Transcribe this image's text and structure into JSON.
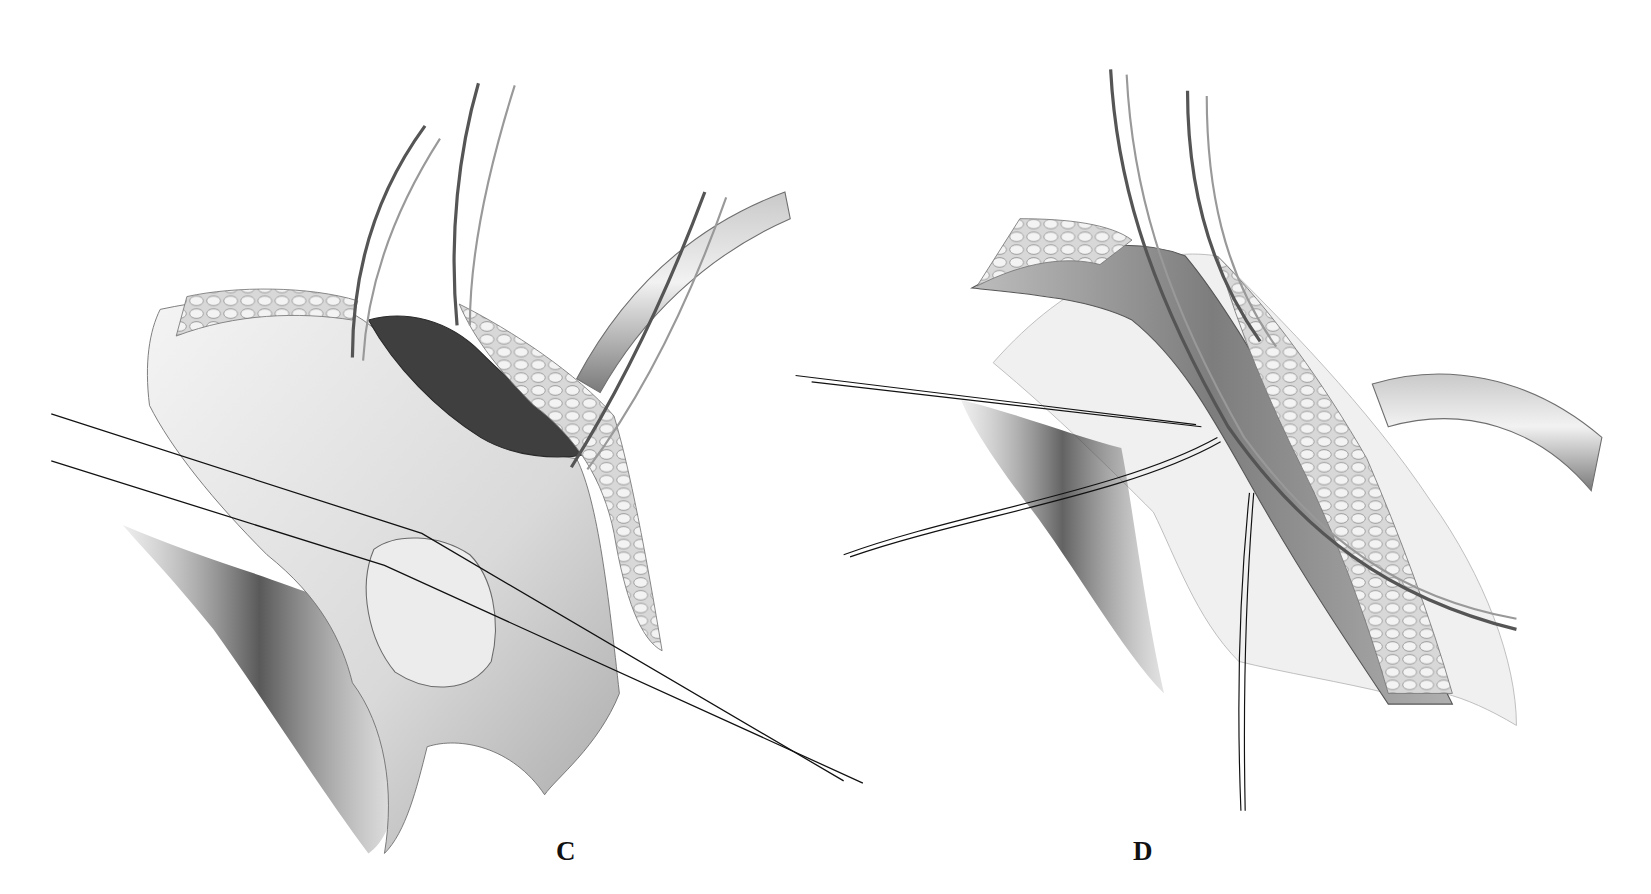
{
  "figure": {
    "type": "surgical-illustration",
    "style": "grayscale pencil rendering",
    "panels": [
      {
        "label": "C",
        "description": "Retraction of tissue flap with three curved hemostats; fatty tissue layer and tubular structure visible; two suture strands crossing diagonally"
      },
      {
        "label": "D",
        "description": "Elongated muscle/tissue band held by two clamps; fatty layer alongside; curved tube exiting right; suture strands on left and descending vertically"
      }
    ]
  },
  "colors": {
    "background": "#ffffff",
    "ink": "#111111",
    "tissue_light": "#e6e6e6",
    "tissue_mid": "#b5b5b5",
    "tissue_dark": "#4a4a4a",
    "instrument": "#8c8c8c"
  }
}
